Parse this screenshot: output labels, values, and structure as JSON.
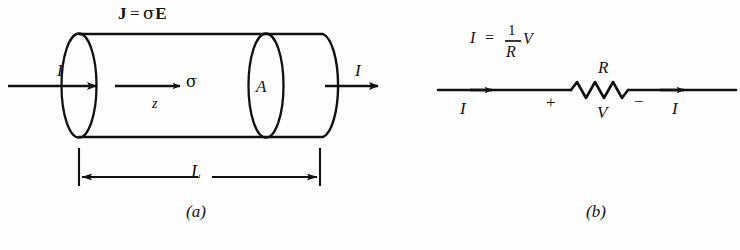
{
  "figure": {
    "ink_color": "#111111",
    "background_color": "#fefefe",
    "panels": [
      {
        "id": "a",
        "caption": "(a)",
        "labels": {
          "constitutive_relation_bold_j": "J",
          "constitutive_relation_equals": "=",
          "constitutive_relation_sigma": "σ",
          "constitutive_relation_bold_e": "E",
          "current_in": "I",
          "current_out": "I",
          "conductivity": "σ",
          "axis": "z",
          "area": "A",
          "length": "L"
        }
      },
      {
        "id": "b",
        "caption": "(b)",
        "labels": {
          "equation_lhs": "I",
          "equation_equals": "=",
          "equation_numerator": "1",
          "equation_denominator": "R",
          "equation_rhs": "V",
          "resistance": "R",
          "voltage": "V",
          "polarity_positive": "+",
          "polarity_negative": "−",
          "current_in": "I",
          "current_out": "I"
        }
      }
    ]
  }
}
